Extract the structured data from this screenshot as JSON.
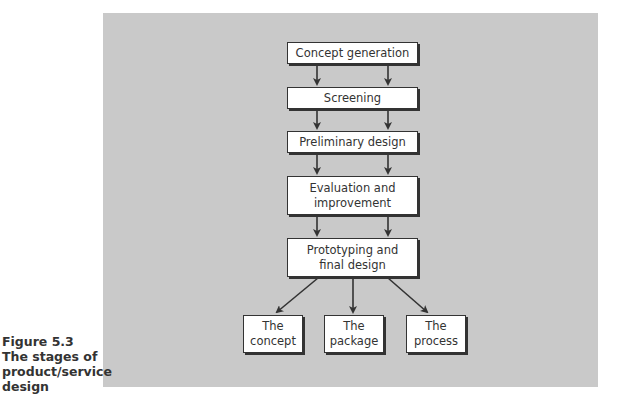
{
  "figure": {
    "number": "Figure 5.3",
    "caption_lines": [
      "The stages of",
      "product/service",
      "design"
    ]
  },
  "flow": {
    "stages": [
      {
        "lines": [
          "Concept generation"
        ]
      },
      {
        "lines": [
          "Screening"
        ]
      },
      {
        "lines": [
          "Preliminary design"
        ]
      },
      {
        "lines": [
          "Evaluation and",
          "improvement"
        ]
      },
      {
        "lines": [
          "Prototyping and",
          "final design"
        ]
      }
    ],
    "outputs": [
      {
        "lines": [
          "The",
          "concept"
        ]
      },
      {
        "lines": [
          "The",
          "package"
        ]
      },
      {
        "lines": [
          "The",
          "process"
        ]
      }
    ]
  },
  "colors": {
    "panel": "#c9c9c9",
    "box": "#ffffff",
    "stroke": "#333333"
  }
}
